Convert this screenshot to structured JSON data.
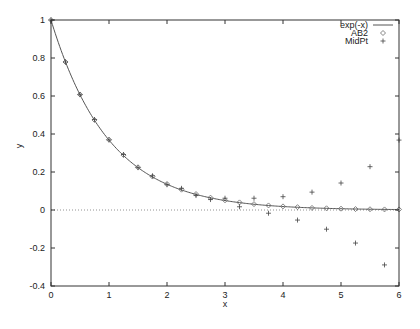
{
  "chart_data": {
    "type": "line",
    "title": "",
    "xlabel": "x",
    "ylabel": "y",
    "xlim": [
      0,
      6
    ],
    "ylim": [
      -0.4,
      1
    ],
    "grid": false,
    "legend_position": "top-right inside",
    "x_ticks": [
      "0",
      "1",
      "2",
      "3",
      "4",
      "5",
      "6"
    ],
    "y_ticks": [
      "-0.4",
      "-0.2",
      "0",
      "0.2",
      "0.4",
      "0.6",
      "0.8",
      "1"
    ],
    "zero_line": "dotted",
    "x": [
      0,
      0.25,
      0.5,
      0.75,
      1.0,
      1.25,
      1.5,
      1.75,
      2.0,
      2.25,
      2.5,
      2.75,
      3.0,
      3.25,
      3.5,
      3.75,
      4.0,
      4.25,
      4.5,
      4.75,
      5.0,
      5.25,
      5.5,
      5.75,
      6.0
    ],
    "series": [
      {
        "name": "exp(-x)",
        "style": "line",
        "values": [
          1.0,
          0.779,
          0.607,
          0.472,
          0.368,
          0.287,
          0.223,
          0.174,
          0.135,
          0.105,
          0.082,
          0.064,
          0.05,
          0.039,
          0.03,
          0.024,
          0.018,
          0.014,
          0.011,
          0.009,
          0.007,
          0.005,
          0.004,
          0.003,
          0.002
        ]
      },
      {
        "name": "AB2",
        "style": "diamond",
        "values": [
          1.0,
          0.779,
          0.608,
          0.474,
          0.37,
          0.289,
          0.225,
          0.176,
          0.137,
          0.107,
          0.084,
          0.065,
          0.051,
          0.04,
          0.031,
          0.024,
          0.019,
          0.015,
          0.011,
          0.009,
          0.007,
          0.005,
          0.004,
          0.003,
          0.003
        ]
      },
      {
        "name": "MidPt",
        "style": "plus",
        "values": [
          1.0,
          0.779,
          0.607,
          0.476,
          0.369,
          0.292,
          0.223,
          0.18,
          0.133,
          0.114,
          0.076,
          0.076,
          0.038,
          0.057,
          0.01,
          0.052,
          -0.016,
          0.06,
          -0.046,
          0.083,
          -0.088,
          0.127,
          -0.152,
          0.203,
          -0.253
        ]
      }
    ],
    "observed_midpt_markers": [
      {
        "x": 2.75,
        "y": 0.055
      },
      {
        "x": 3.0,
        "y": 0.062
      },
      {
        "x": 3.25,
        "y": 0.017
      },
      {
        "x": 3.5,
        "y": 0.062
      },
      {
        "x": 3.75,
        "y": -0.017
      },
      {
        "x": 4.0,
        "y": 0.07
      },
      {
        "x": 4.25,
        "y": -0.053
      },
      {
        "x": 4.5,
        "y": 0.094
      },
      {
        "x": 4.75,
        "y": -0.101
      },
      {
        "x": 5.0,
        "y": 0.142
      },
      {
        "x": 5.25,
        "y": -0.174
      },
      {
        "x": 5.5,
        "y": 0.228
      },
      {
        "x": 5.75,
        "y": -0.289
      },
      {
        "x": 6.0,
        "y": 0.368
      }
    ]
  },
  "legend": {
    "items": [
      {
        "label": "exp(-x)",
        "symbol": "line"
      },
      {
        "label": "AB2",
        "symbol": "diamond"
      },
      {
        "label": "MidPt",
        "symbol": "plus"
      }
    ]
  },
  "axes": {
    "xlabel": "x",
    "ylabel": "y"
  },
  "colors": {
    "axis": "#333333",
    "curve": "#555555",
    "marker": "#444444",
    "zero_line": "#777777"
  }
}
